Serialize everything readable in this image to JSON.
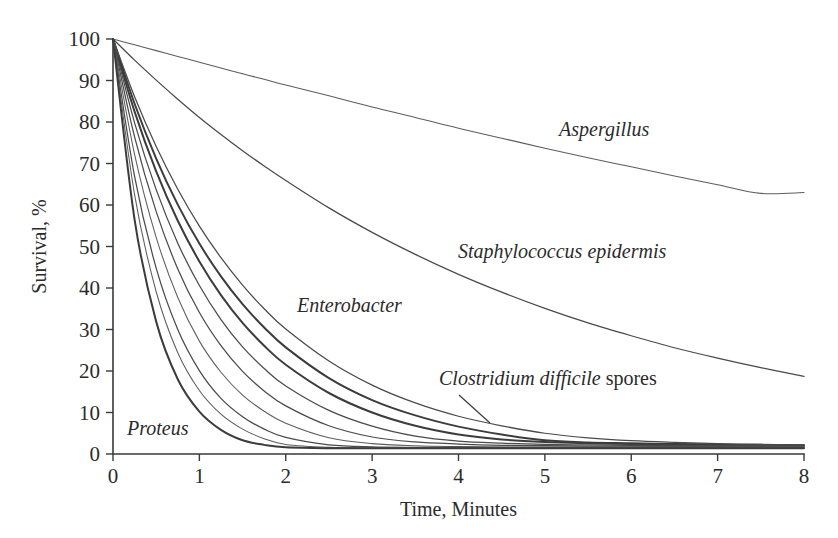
{
  "chart_data": {
    "type": "line",
    "title": "",
    "xlabel": "Time, Minutes",
    "ylabel": "Survival, %",
    "xlim": [
      0,
      8
    ],
    "ylim": [
      0,
      100
    ],
    "xticks": [
      "0",
      "1",
      "2",
      "3",
      "4",
      "5",
      "6",
      "7",
      "8"
    ],
    "yticks": [
      "0",
      "10",
      "20",
      "30",
      "40",
      "50",
      "60",
      "70",
      "80",
      "90",
      "100"
    ],
    "grid": false,
    "legend_position": "inline-annotations",
    "x": [
      0,
      0.25,
      0.5,
      0.75,
      1,
      1.25,
      1.5,
      1.75,
      2,
      2.5,
      3,
      3.5,
      4,
      4.5,
      5,
      5.5,
      6,
      6.5,
      7,
      7.5,
      8
    ],
    "series": [
      {
        "name": "Aspergillus",
        "style": "thin",
        "values": [
          100,
          98.6,
          97.2,
          95.8,
          94.4,
          93.0,
          91.6,
          90.3,
          88.9,
          86.3,
          83.6,
          81.1,
          78.5,
          76.1,
          73.7,
          71.4,
          69.2,
          67.0,
          64.9,
          62.8,
          63.0
        ]
      },
      {
        "name": "Staphylococcus epidermis",
        "style": "normal",
        "values": [
          100,
          94.9,
          90.1,
          85.5,
          81.1,
          77.0,
          73.1,
          69.4,
          65.9,
          59.3,
          53.4,
          48.1,
          43.3,
          39.0,
          35.1,
          31.6,
          28.5,
          25.6,
          23.1,
          20.8,
          18.7
        ]
      },
      {
        "name": "Enterobacter",
        "style": "thick",
        "values": [
          100,
          84.4,
          71.2,
          60.1,
          50.7,
          42.8,
          36.1,
          30.5,
          25.7,
          18.3,
          13.0,
          9.3,
          6.6,
          4.7,
          3.3,
          2.8,
          2.6,
          2.4,
          2.3,
          2.2,
          2.1
        ]
      },
      {
        "name": "Clostridium difficile spores",
        "style": "thick",
        "values": [
          100,
          82.5,
          68.1,
          56.2,
          46.4,
          38.3,
          31.6,
          26.1,
          21.5,
          14.7,
          10.0,
          6.8,
          4.7,
          3.5,
          2.9,
          2.6,
          2.4,
          2.3,
          2.2,
          2.1,
          2.0
        ]
      },
      {
        "name": "curve-5",
        "style": "normal",
        "values": [
          100,
          76.4,
          58.4,
          44.6,
          34.1,
          26.1,
          19.9,
          15.2,
          11.6,
          6.8,
          4.1,
          2.9,
          2.4,
          2.1,
          2.0,
          1.9,
          1.9,
          1.8,
          1.8,
          1.8,
          1.8
        ]
      },
      {
        "name": "curve-6",
        "style": "thin",
        "values": [
          100,
          72.2,
          52.2,
          37.7,
          27.2,
          19.7,
          14.2,
          10.3,
          7.4,
          3.9,
          2.5,
          2.0,
          1.8,
          1.7,
          1.7,
          1.7,
          1.7,
          1.7,
          1.7,
          1.7,
          1.7
        ]
      },
      {
        "name": "curve-7",
        "style": "normal",
        "values": [
          100,
          66.9,
          44.8,
          30.0,
          20.1,
          13.4,
          9.0,
          6.0,
          4.0,
          2.2,
          1.7,
          1.6,
          1.6,
          1.6,
          1.6,
          1.6,
          1.6,
          1.6,
          1.6,
          1.6,
          1.6
        ]
      },
      {
        "name": "curve-8",
        "style": "thin",
        "values": [
          100,
          62.5,
          39.1,
          24.4,
          15.3,
          9.6,
          6.0,
          3.7,
          2.3,
          1.6,
          1.5,
          1.5,
          1.5,
          1.5,
          1.5,
          1.5,
          1.5,
          1.5,
          1.5,
          1.5,
          1.5
        ]
      },
      {
        "name": "Proteus",
        "style": "thick",
        "values": [
          100,
          56.5,
          31.9,
          18.0,
          10.2,
          5.8,
          3.3,
          2.2,
          1.6,
          1.4,
          1.4,
          1.4,
          1.4,
          1.4,
          1.4,
          1.4,
          1.4,
          1.4,
          1.4,
          1.4,
          1.4
        ]
      },
      {
        "name": "curve-10",
        "style": "normal",
        "values": [
          100,
          79.8,
          63.7,
          50.8,
          40.6,
          32.4,
          25.8,
          20.6,
          16.4,
          10.5,
          6.7,
          4.3,
          3.1,
          2.6,
          2.3,
          2.2,
          2.1,
          2.1,
          2.0,
          2.0,
          2.0
        ]
      },
      {
        "name": "curve-11",
        "style": "normal",
        "values": [
          100,
          86.1,
          74.1,
          63.8,
          54.9,
          47.3,
          40.7,
          35.0,
          30.1,
          22.4,
          16.6,
          12.3,
          9.1,
          6.8,
          5.0,
          3.9,
          3.2,
          2.8,
          2.5,
          2.3,
          2.2
        ]
      }
    ],
    "annotations": [
      {
        "id": "aspergillus",
        "italic": "Aspergillus",
        "roman": "",
        "x_px": 559,
        "y_px": 136
      },
      {
        "id": "staph",
        "italic": "Staphylococcus epidermis",
        "roman": "",
        "x_px": 458,
        "y_px": 258
      },
      {
        "id": "enterobacter",
        "italic": "Enterobacter",
        "roman": "",
        "x_px": 297,
        "y_px": 312
      },
      {
        "id": "clostridium",
        "italic": "Clostridium difficile",
        "roman": " spores",
        "x_px": 439,
        "y_px": 385
      },
      {
        "id": "proteus",
        "italic": "Proteus",
        "roman": "",
        "x_px": 127,
        "y_px": 435
      }
    ]
  },
  "geometry": {
    "plot_left_px": 113,
    "plot_right_px": 804,
    "plot_top_px": 39,
    "plot_bottom_px": 454,
    "leader_line": {
      "x1": 459,
      "y1": 395,
      "x2": 490,
      "y2": 423
    }
  },
  "colors": {
    "background": "#ffffff",
    "ink": "#2b2b2b",
    "curve": "#4a4a4a",
    "axis": "#3a3a3a"
  }
}
